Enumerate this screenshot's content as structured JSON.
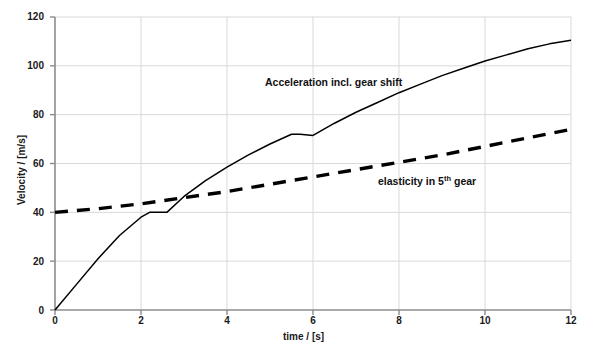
{
  "chart_data": {
    "type": "line",
    "title": "",
    "xlabel": "time / [s]",
    "ylabel": "Velocity / [m/s]",
    "xlim": [
      0,
      12
    ],
    "ylim": [
      0,
      120
    ],
    "xticks": [
      "0",
      "2",
      "4",
      "6",
      "8",
      "10",
      "12"
    ],
    "yticks": [
      "0",
      "20",
      "40",
      "60",
      "80",
      "100",
      "120"
    ],
    "grid": true,
    "legend_position": "inline-annotations",
    "series": [
      {
        "name": "Acceleration incl. gear shift",
        "style": "solid",
        "color": "#000000",
        "points": [
          [
            0.0,
            0.0
          ],
          [
            0.5,
            10.5
          ],
          [
            1.0,
            21.0
          ],
          [
            1.5,
            30.5
          ],
          [
            2.0,
            38.0
          ],
          [
            2.2,
            40.0
          ],
          [
            2.6,
            40.0
          ],
          [
            3.0,
            46.5
          ],
          [
            3.5,
            53.0
          ],
          [
            4.0,
            58.5
          ],
          [
            4.5,
            63.5
          ],
          [
            5.0,
            68.0
          ],
          [
            5.5,
            72.0
          ],
          [
            5.7,
            72.0
          ],
          [
            6.0,
            71.5
          ],
          [
            6.5,
            76.5
          ],
          [
            7.0,
            81.0
          ],
          [
            7.5,
            85.0
          ],
          [
            8.0,
            89.0
          ],
          [
            8.5,
            92.5
          ],
          [
            9.0,
            96.0
          ],
          [
            9.5,
            99.0
          ],
          [
            10.0,
            102.0
          ],
          [
            10.5,
            104.5
          ],
          [
            11.0,
            107.0
          ],
          [
            11.5,
            109.0
          ],
          [
            12.0,
            110.5
          ]
        ]
      },
      {
        "name": "elasticity in 5th gear",
        "style": "dashed",
        "color": "#000000",
        "points": [
          [
            0.0,
            40.0
          ],
          [
            1.0,
            41.5
          ],
          [
            2.0,
            43.5
          ],
          [
            3.0,
            46.0
          ],
          [
            4.0,
            48.5
          ],
          [
            5.0,
            51.5
          ],
          [
            6.0,
            54.5
          ],
          [
            7.0,
            57.5
          ],
          [
            8.0,
            60.5
          ],
          [
            9.0,
            63.5
          ],
          [
            10.0,
            67.0
          ],
          [
            11.0,
            70.5
          ],
          [
            12.0,
            74.0
          ]
        ]
      }
    ],
    "annotations": [
      {
        "id": "accel-label",
        "text_before": "Acceleration incl. gear shift",
        "sup": "",
        "text_after": ""
      },
      {
        "id": "elasticity-label",
        "text_before": "elasticity in 5",
        "sup": "th",
        "text_after": " gear"
      }
    ],
    "colors": {
      "axis": "#808080",
      "grid": "#d9d9d9",
      "line": "#000000",
      "text": "#1a1a1a",
      "background": "#ffffff"
    }
  }
}
